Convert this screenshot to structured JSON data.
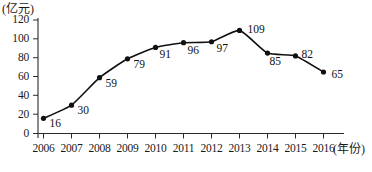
{
  "chart_data": {
    "type": "line",
    "title": "",
    "subtitle": "",
    "xlabel": "(年份)",
    "ylabel": "(亿元)",
    "categories": [
      "2006",
      "2007",
      "2008",
      "2009",
      "2010",
      "2011",
      "2012",
      "2013",
      "2014",
      "2015",
      "2016"
    ],
    "values": [
      16,
      30,
      59,
      79,
      91,
      96,
      97,
      109,
      85,
      82,
      65
    ],
    "data_labels": [
      "16",
      "30",
      "59",
      "79",
      "91",
      "96",
      "97",
      "109",
      "85",
      "82",
      "65"
    ],
    "ylim": [
      0,
      120
    ],
    "ytick_labels": [
      "0",
      "20",
      "40",
      "60",
      "80",
      "100",
      "120"
    ],
    "ytick_values": [
      0,
      20,
      40,
      60,
      80,
      100,
      120
    ],
    "grid": false,
    "legend": null,
    "legend_position": "none",
    "marker": "filled-circle",
    "line_color": "#111111",
    "marker_color": "#111111",
    "axis_color": "#2b2b2b",
    "background_color": "#ffffff",
    "smoothing": "spline"
  },
  "axes": {
    "y_title": "(亿元)",
    "x_title": "(年份)"
  }
}
